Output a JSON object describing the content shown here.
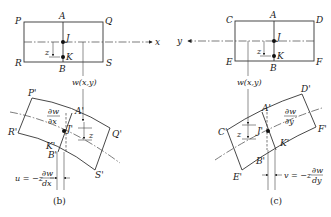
{
  "diagram": {
    "left": {
      "caption": "(b)",
      "axis_label": "x",
      "undeformed": {
        "corners": [
          "P",
          "Q",
          "R",
          "S"
        ],
        "top_mid": "A",
        "bottom_mid": "B",
        "mid_point": "J",
        "offset_point": "K",
        "offset_label": "z"
      },
      "deflection_label": "w(x,y)",
      "deformed": {
        "corners": [
          "P'",
          "Q'",
          "R'",
          "S'"
        ],
        "top_mid": "A'",
        "bottom_mid": "B'",
        "mid_point": "J'",
        "offset_point": "K'",
        "offset_label": "z"
      },
      "slope_num": "∂w",
      "slope_den": "∂x",
      "displacement_prefix": "u = −z",
      "displacement_num": "∂w",
      "displacement_den": "dx"
    },
    "right": {
      "caption": "(c)",
      "axis_label": "y",
      "undeformed": {
        "corners": [
          "C",
          "D",
          "E",
          "F"
        ],
        "top_mid": "A",
        "bottom_mid": "B",
        "mid_point": "J",
        "offset_point": "K",
        "offset_label": "z"
      },
      "deflection_label": "w(x,y)",
      "deformed": {
        "corners": [
          "C'",
          "D'",
          "E'",
          "F'"
        ],
        "top_mid": "A'",
        "bottom_mid": "B'",
        "mid_point": "J'",
        "offset_point": "K'",
        "offset_label": "z"
      },
      "slope_num": "∂w",
      "slope_den": "∂y",
      "displacement_prefix": "v = −z",
      "displacement_num": "∂w",
      "displacement_den": "dy"
    }
  }
}
